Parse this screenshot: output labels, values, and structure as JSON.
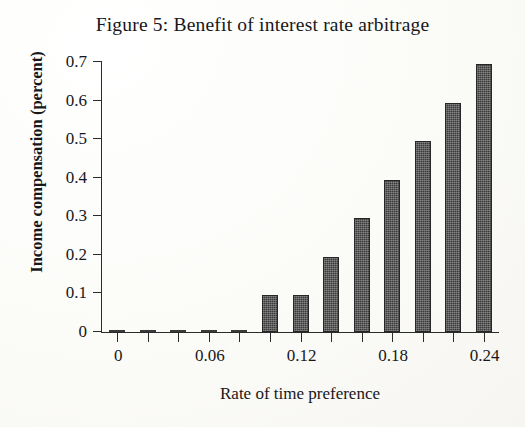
{
  "figure": {
    "title": "Figure 5:  Benefit of interest rate arbitrage"
  },
  "chart_data": {
    "type": "bar",
    "title": "Figure 5:  Benefit of interest rate arbitrage",
    "xlabel": "Rate of time preference",
    "ylabel": "Income compensation (percent)",
    "x": [
      0,
      0.02,
      0.04,
      0.06,
      0.08,
      0.1,
      0.12,
      0.14,
      0.16,
      0.18,
      0.2,
      0.22,
      0.24
    ],
    "values": [
      0,
      0,
      0,
      0,
      0,
      0.095,
      0.095,
      0.195,
      0.295,
      0.395,
      0.495,
      0.595,
      0.695
    ],
    "xlim": [
      -0.01,
      0.25
    ],
    "ylim": [
      0,
      0.7
    ],
    "xticks": [
      0,
      0.02,
      0.04,
      0.06,
      0.08,
      0.1,
      0.12,
      0.14,
      0.16,
      0.18,
      0.2,
      0.22,
      0.24
    ],
    "xtick_labels": [
      "0",
      "",
      "",
      "0.06",
      "",
      "",
      "0.12",
      "",
      "",
      "0.18",
      "",
      "",
      "0.24"
    ],
    "yticks": [
      0,
      0.1,
      0.2,
      0.3,
      0.4,
      0.5,
      0.6,
      0.7
    ],
    "ytick_labels": [
      "0",
      "0.1",
      "0.2",
      "0.3",
      "0.4",
      "0.5",
      "0.6",
      "0.7"
    ],
    "grid": false,
    "legend": false,
    "bar_color": "#3b3b3b"
  }
}
